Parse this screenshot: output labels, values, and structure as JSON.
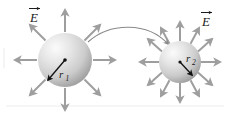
{
  "figure": {
    "name": "electric-field-two-charged-spheres",
    "background": "#ffffff",
    "width": 229,
    "height": 114,
    "border_color": "#d9d9d9"
  },
  "labels": {
    "field_left": "E",
    "field_left_accent": "→",
    "field_right": "E",
    "field_right_accent": "→",
    "radius_left": "r",
    "radius_left_sub": "1",
    "radius_right": "r",
    "radius_right_sub": "2"
  },
  "spheres": [
    {
      "id": "sphere-left",
      "cx": 65,
      "cy": 60,
      "r": 27,
      "fill_light": "#f2f2f2",
      "fill_mid": "#d0d0d0",
      "fill_dark": "#9a9a9a",
      "arrow_count": 8,
      "radius_label": "r1"
    },
    {
      "id": "sphere-right",
      "cx": 180,
      "cy": 62,
      "r": 21,
      "fill_light": "#f2f2f2",
      "fill_mid": "#d0d0d0",
      "fill_dark": "#9a9a9a",
      "arrow_count": 12,
      "radius_label": "r2"
    }
  ],
  "field_arrows": {
    "color": "#9e9e9e",
    "stroke_width": 2
  },
  "radius_arrows": {
    "color": "#111111",
    "stroke_width": 1.3
  },
  "connector": {
    "name": "curved-transfer-arrow",
    "color": "#8a8a8a",
    "stroke_width": 1.1,
    "from": "sphere-left",
    "to": "sphere-right"
  }
}
